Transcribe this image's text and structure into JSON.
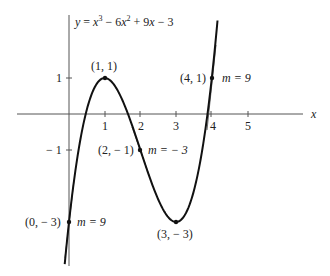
{
  "equation": "y = x³ − 6x² + 9x − 3",
  "equation_parts": {
    "y": "y",
    "eq": " = ",
    "x1": "x",
    "e1": "3",
    "m1": " − 6",
    "x2": "x",
    "e2": "2",
    "m2": " + 9",
    "x3": "x",
    "tail": " − 3"
  },
  "axes": {
    "x_label": "x",
    "x_ticks": [
      {
        "value": 1,
        "label": "1"
      },
      {
        "value": 2,
        "label": "2"
      },
      {
        "value": 3,
        "label": "3"
      },
      {
        "value": 4,
        "label": "4"
      },
      {
        "value": 5,
        "label": "5"
      }
    ],
    "y_ticks": [
      {
        "value": 1,
        "label": "1"
      },
      {
        "value": -1,
        "label": "− 1"
      }
    ]
  },
  "points": [
    {
      "coord": "(1, 1)",
      "x": 1,
      "y": 1,
      "slope": null
    },
    {
      "coord": "(2, − 1)",
      "x": 2,
      "y": -1,
      "slope_label": "m = − 3",
      "slope": -3
    },
    {
      "coord": "(3, − 3)",
      "x": 3,
      "y": -3,
      "slope": null
    },
    {
      "coord": "(0, − 3)",
      "x": 0,
      "y": -3,
      "slope_label": "m = 9",
      "slope": 9
    },
    {
      "coord": "(4, 1)",
      "x": 4,
      "y": 1,
      "slope_label": "m = 9",
      "slope": 9
    }
  ],
  "colors": {
    "curve": "#111111",
    "axis": "#555555",
    "text": "#222222"
  }
}
